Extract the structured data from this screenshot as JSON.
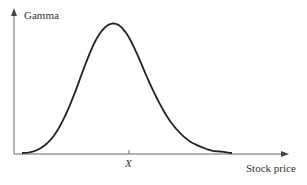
{
  "chart_data": {
    "type": "line",
    "title": "",
    "xlabel": "Stock price",
    "ylabel": "Gamma",
    "x_ticks": [
      "X"
    ],
    "series": [
      {
        "name": "Gamma",
        "description": "Bell-shaped curve peaking at strike price X",
        "x": [
          0.0,
          0.1,
          0.2,
          0.3,
          0.4,
          0.5,
          0.6,
          0.7,
          0.8,
          0.9,
          1.0,
          1.1,
          1.2,
          1.3,
          1.4,
          1.5,
          1.6,
          1.7,
          1.8,
          1.9,
          2.0
        ],
        "values": [
          0.0,
          0.01,
          0.05,
          0.13,
          0.27,
          0.46,
          0.68,
          0.87,
          0.98,
          1.0,
          0.92,
          0.76,
          0.57,
          0.4,
          0.26,
          0.16,
          0.09,
          0.05,
          0.02,
          0.01,
          0.0
        ]
      }
    ],
    "grid": false,
    "legend": "none"
  },
  "labels": {
    "y_axis": "Gamma",
    "x_axis": "Stock price",
    "tick": "X"
  },
  "colors": {
    "axis": "#666666",
    "curve": "#222222",
    "text": "#333333"
  }
}
